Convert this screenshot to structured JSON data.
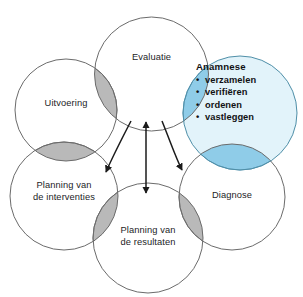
{
  "diagram": {
    "colors": {
      "background": "#ffffff",
      "circle_stroke": "#6b6b6b",
      "circle_fill": "#ffffff",
      "highlight_fill": "#e2f3fa",
      "highlight_overlap": "#8fcce8",
      "overlap_gray": "#b9b9b9",
      "overlap_gray_stroke": "#6f6f6f",
      "arrow": "#1b1b1b",
      "text": "#1d1d1f"
    },
    "nodes": [
      {
        "id": "evaluatie",
        "label_lines": [
          "Evaluatie"
        ],
        "highlighted": false
      },
      {
        "id": "anamnese",
        "label_lines": [
          "Anamnese"
        ],
        "highlighted": true,
        "heading": "Anamnese",
        "bullets": [
          "verzamelen",
          "verifiëren",
          "ordenen",
          "vastleggen"
        ],
        "bullet_glyph": "•"
      },
      {
        "id": "diagnose",
        "label_lines": [
          "Diagnose"
        ],
        "highlighted": false
      },
      {
        "id": "planning-resultaten",
        "label_lines": [
          "Planning van",
          "de resultaten"
        ],
        "highlighted": false
      },
      {
        "id": "planning-interventies",
        "label_lines": [
          "Planning van",
          "de interventies"
        ],
        "highlighted": false
      },
      {
        "id": "uitvoering",
        "label_lines": [
          "Uitvoering"
        ],
        "highlighted": false
      }
    ],
    "connectors": [
      {
        "id": "arrow-vertical",
        "kind": "double-headed-straight"
      },
      {
        "id": "arrow-curve-left",
        "kind": "single-headed-curve"
      },
      {
        "id": "arrow-curve-right",
        "kind": "single-headed-curve"
      }
    ]
  }
}
